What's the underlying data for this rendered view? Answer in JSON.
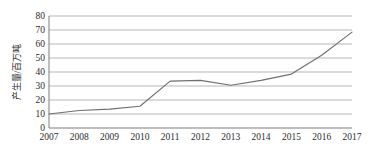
{
  "chart_data": {
    "type": "line",
    "title": "",
    "xlabel": "",
    "ylabel": "产生量/百万吨",
    "categories": [
      "2007",
      "2008",
      "2009",
      "2010",
      "2011",
      "2012",
      "2013",
      "2014",
      "2015",
      "2016",
      "2017"
    ],
    "values": [
      10,
      12.5,
      13.5,
      15.5,
      33.5,
      34,
      30.5,
      34,
      38.5,
      52,
      68.5
    ],
    "series": [
      {
        "name": "产生量",
        "values": [
          10,
          12.5,
          13.5,
          15.5,
          33.5,
          34,
          30.5,
          34,
          38.5,
          52,
          68.5
        ]
      }
    ],
    "ylim": [
      0,
      80
    ],
    "yticks": [
      0,
      10,
      20,
      30,
      40,
      50,
      60,
      70,
      80
    ],
    "ytick_labels": [
      "0",
      "10",
      "20",
      "30",
      "40",
      "50",
      "60",
      "70",
      "80"
    ],
    "xtick_labels": [
      "2007",
      "2008",
      "2009",
      "2010",
      "2011",
      "2012",
      "2013",
      "2014",
      "2015",
      "2016",
      "2017"
    ],
    "grid": "horizontal",
    "legend": "none",
    "line_color": "#6f6f6f",
    "grid_color": "#9a9a9a",
    "axis_color": "#6e6e6e",
    "text_color": "#2b2b2b",
    "background_color": "#ffffff"
  }
}
